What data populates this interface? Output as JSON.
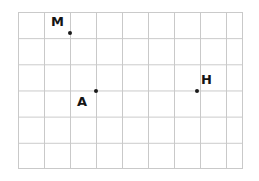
{
  "figure": {
    "name": "coordinate-grid-with-plotted-points",
    "background_color": "#ffffff",
    "grid": {
      "line_color": "#c9c9c9",
      "columns": 9,
      "rows": 6,
      "cell_width_px": 26,
      "cell_height_px": 26,
      "left_px": 18,
      "top_px": 12,
      "width_px": 225,
      "height_px": 157
    },
    "point_color": "#1a1a1a",
    "label_color": "#141414"
  },
  "points": [
    {
      "label": "M",
      "x_px": 70,
      "y_px": 33,
      "grid_col": 2,
      "grid_row": 1,
      "label_x_px": 51,
      "label_y_px": 15,
      "label_position": "upper-left"
    },
    {
      "label": "A",
      "x_px": 96,
      "y_px": 91,
      "grid_col": 3,
      "grid_row": 3,
      "label_x_px": 77,
      "label_y_px": 95,
      "label_position": "lower-left"
    },
    {
      "label": "H",
      "x_px": 197,
      "y_px": 91,
      "grid_col": 7,
      "grid_row": 3,
      "label_x_px": 201,
      "label_y_px": 73,
      "label_position": "upper-right"
    }
  ],
  "chart_data": {
    "type": "scatter",
    "title": "",
    "xlabel": "",
    "ylabel": "",
    "grid": true,
    "legend": "none",
    "xlim": [
      0,
      9
    ],
    "ylim": [
      0,
      6
    ],
    "categories": [
      "M",
      "A",
      "H"
    ],
    "series": [
      {
        "name": "plotted points",
        "points": [
          {
            "label": "M",
            "x": 2,
            "y": 5
          },
          {
            "label": "A",
            "x": 3,
            "y": 3
          },
          {
            "label": "H",
            "x": 7,
            "y": 3
          }
        ]
      }
    ]
  }
}
